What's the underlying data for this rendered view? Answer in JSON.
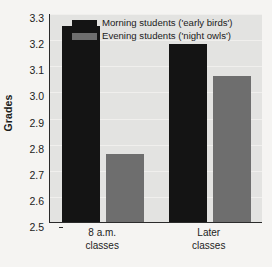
{
  "chart_data": {
    "type": "bar",
    "title": "",
    "subtitle": "",
    "xlabel": "",
    "ylabel": "Grades",
    "ylim": [
      2.5,
      3.3
    ],
    "ytick_step": 0.1,
    "yticks": [
      "3.3",
      "3.2",
      "3.1",
      "3.0",
      "2.9",
      "2.8",
      "2.7",
      "2.6",
      "2.5"
    ],
    "ytick_values": [
      3.3,
      3.2,
      3.1,
      3.0,
      2.9,
      2.8,
      2.7,
      2.6,
      2.5
    ],
    "grid": true,
    "grid_axis": "y",
    "legend_position": "top-inside-left",
    "categories": [
      "8 a.m.\nclasses",
      "Later\nclasses"
    ],
    "category_lines": [
      [
        "8 a.m.",
        "classes"
      ],
      [
        "Later",
        "classes"
      ]
    ],
    "series": [
      {
        "name": "Morning students ('early birds')",
        "color": "#141414",
        "values": [
          3.25,
          3.18
        ]
      },
      {
        "name": "Evening students ('night owls')",
        "color": "#6e6e6e",
        "values": [
          2.76,
          3.06
        ]
      }
    ]
  },
  "legend": {
    "items": [
      {
        "label": "Morning students ('early birds')",
        "color": "#141414"
      },
      {
        "label": "Evening students ('night owls')",
        "color": "#6e6e6e"
      }
    ]
  },
  "axis": {
    "y_title": "Grades"
  },
  "colors": {
    "page_background": "#f5f4f2",
    "plot_background": "#e3e3e1",
    "gridline": "#f0efed",
    "axis_line": "#2b2b2b",
    "series_morning": "#141414",
    "series_evening": "#6e6e6e",
    "text": "#1c1c1c"
  }
}
